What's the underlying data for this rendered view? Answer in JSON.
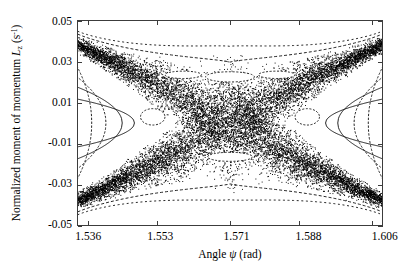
{
  "figure": {
    "background_color": "#ffffff",
    "frame_color": "#3c3c3c",
    "data_color": "#000000"
  },
  "axes": {
    "x": {
      "title": "Angle ψ (rad)",
      "title_prefix": "Angle ",
      "title_symbol": "ψ",
      "title_suffix": " (rad)",
      "ticks": [
        "1.536",
        "1.553",
        "1.571",
        "1.588",
        "1.606"
      ],
      "tick_values": [
        1.536,
        1.553,
        1.571,
        1.588,
        1.606
      ],
      "min": 1.5335,
      "max": 1.6085
    },
    "y": {
      "title_prefix": "Normalized moment of momentum ",
      "title_symbol": "L",
      "title_subscript": "z",
      "title_unit_open": " (s",
      "title_unit_sup": "-1",
      "title_unit_close": ")",
      "title": "Normalized moment of momentum L_z (s-1)",
      "ticks": [
        "0.05",
        "0.03",
        "0.01",
        "-0.01",
        "-0.03",
        "-0.05"
      ],
      "tick_values": [
        0.05,
        0.03,
        0.01,
        -0.01,
        -0.03,
        -0.05
      ],
      "min": -0.05,
      "max": 0.05
    }
  },
  "chart_data": {
    "type": "scatter",
    "title": "",
    "subtitle": "",
    "xlabel": "Angle ψ (rad)",
    "ylabel": "Normalized moment of momentum L_z (s^-1)",
    "xlim": [
      1.5335,
      1.6085
    ],
    "ylim": [
      -0.05,
      0.05
    ],
    "grid": false,
    "legend": false,
    "x_ticks": [
      1.536,
      1.553,
      1.571,
      1.588,
      1.606
    ],
    "y_ticks": [
      0.05,
      0.03,
      0.01,
      -0.01,
      -0.03,
      -0.05
    ],
    "center_x": 1.571,
    "center_y": 0.0,
    "separatrix_half_width_at_center": 0.022,
    "separatrix_half_width_at_edge": 0.004,
    "upper_band_edge_left": 0.038,
    "lower_band_edge_left": -0.038,
    "upper_band_edge_right": 0.038,
    "lower_band_edge_right": -0.038,
    "kam_tori_left": [
      {
        "vertex_x": 1.5475,
        "half_height": 0.012
      },
      {
        "vertex_x": 1.5445,
        "half_height": 0.018
      },
      {
        "vertex_x": 1.5405,
        "half_height": 0.023
      },
      {
        "vertex_x": 1.537,
        "half_height": 0.028
      }
    ],
    "kam_tori_right": [
      {
        "vertex_x": 1.5945,
        "half_height": 0.012
      },
      {
        "vertex_x": 1.5975,
        "half_height": 0.018
      },
      {
        "vertex_x": 1.6015,
        "half_height": 0.023
      },
      {
        "vertex_x": 1.605,
        "half_height": 0.028
      }
    ],
    "islands": [
      {
        "cx": 1.571,
        "cy": 0.0225,
        "rx": 0.006,
        "ry": 0.0025
      },
      {
        "cx": 1.5595,
        "cy": 0.0235,
        "rx": 0.0045,
        "ry": 0.0018
      },
      {
        "cx": 1.5825,
        "cy": 0.0235,
        "rx": 0.0045,
        "ry": 0.0018
      },
      {
        "cx": 1.571,
        "cy": -0.0165,
        "rx": 0.0055,
        "ry": 0.0022
      },
      {
        "cx": 1.552,
        "cy": 0.003,
        "rx": 0.003,
        "ry": 0.004
      },
      {
        "cx": 1.59,
        "cy": 0.003,
        "rx": 0.003,
        "ry": 0.004
      }
    ],
    "point_count_estimate": 18000,
    "marker": "dot",
    "marker_size_px": 0.9
  }
}
